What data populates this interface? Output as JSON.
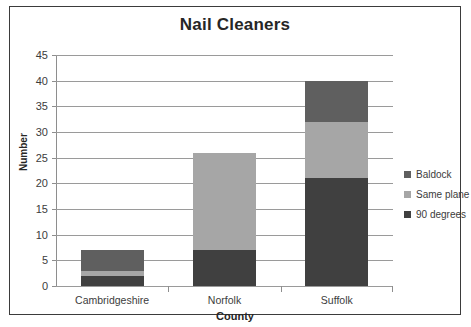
{
  "chart_data": {
    "type": "bar",
    "subtype": "stacked-bar",
    "title": "Nail Cleaners",
    "xlabel": "County",
    "ylabel": "Number",
    "categories": [
      "Cambridgeshire",
      "Norfolk",
      "Suffolk"
    ],
    "series": [
      {
        "name": "90 degrees",
        "values": [
          2,
          7,
          21
        ],
        "color": "#404040"
      },
      {
        "name": "Same plane",
        "values": [
          1,
          19,
          11
        ],
        "color": "#a6a6a6"
      },
      {
        "name": "Baldock",
        "values": [
          4,
          0,
          8
        ],
        "color": "#5f5f5f"
      }
    ],
    "totals": [
      7,
      26,
      40
    ],
    "ylim": [
      0,
      45
    ],
    "ytick_step": 5,
    "yticks": [
      "45",
      "40",
      "35",
      "30",
      "25",
      "20",
      "15",
      "10",
      "5",
      "0"
    ],
    "grid": true,
    "legend_position": "right",
    "legend_entries": [
      "Baldock",
      "Same plane",
      "90 degrees"
    ]
  },
  "colors": {
    "frame": "#3b3b3b",
    "gridline": "#9a9a9a",
    "axis": "#8e8e8e",
    "text": "#3c3c3c",
    "title_text": "#262626",
    "background": "#ffffff"
  }
}
